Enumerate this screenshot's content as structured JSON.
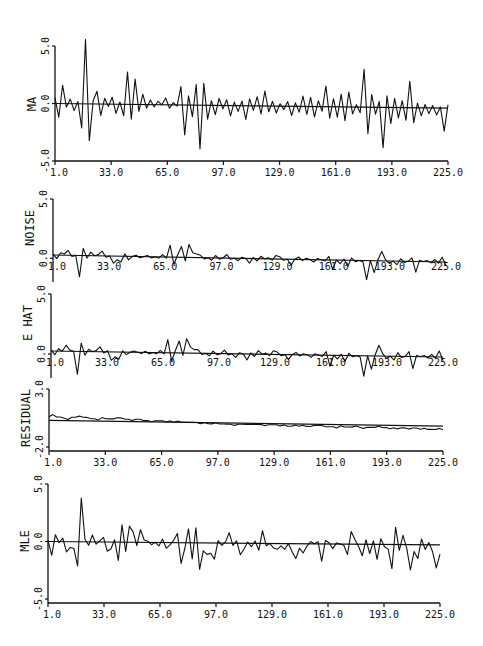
{
  "chart_data": [
    {
      "type": "line",
      "panel": "MA",
      "ylabel": "MA",
      "yticks": [
        "5.0",
        "0.0",
        "-5.0"
      ],
      "ylim": [
        -5.0,
        5.0
      ],
      "xticks": [
        "1.0",
        "33.0",
        "65.0",
        "97.0",
        "129.0",
        "161.0",
        "193.0",
        "225.0"
      ],
      "xlim": [
        1,
        225
      ],
      "baseline": [
        0.0,
        -0.4
      ],
      "x_step": 3,
      "values": [
        0.5,
        -1.2,
        1.6,
        -0.3,
        0.4,
        -0.6,
        0.2,
        -2.1,
        5.6,
        -3.2,
        0.3,
        1.1,
        -1.0,
        0.5,
        -0.2,
        0.6,
        -0.8,
        0.2,
        -1.0,
        2.8,
        -1.3,
        2.2,
        -0.6,
        0.9,
        -0.3,
        0.4,
        -0.2,
        0.3,
        0.0,
        0.6,
        -0.3,
        0.2,
        -0.1,
        1.6,
        -2.6,
        0.8,
        -1.0,
        1.8,
        -3.8,
        1.9,
        -1.2,
        0.4,
        -0.8,
        0.6,
        -0.3,
        0.5,
        -0.9,
        0.3,
        -0.5,
        0.4,
        -1.2,
        0.6,
        -0.4,
        0.8,
        -0.7,
        1.3,
        -0.5,
        0.4,
        -0.6,
        0.2,
        -0.3,
        0.4,
        -0.8,
        0.3,
        -0.5,
        0.9,
        -0.7,
        0.8,
        -0.9,
        0.5,
        -0.4,
        1.8,
        -1.0,
        0.7,
        -0.9,
        1.1,
        -1.2,
        1.3,
        -0.6,
        0.2,
        -0.5,
        3.3,
        -2.3,
        1.1,
        -0.6,
        0.5,
        -3.5,
        1.0,
        -1.4,
        0.8,
        -0.9,
        0.6,
        -1.1,
        2.3,
        -1.3,
        0.4,
        -0.7,
        0.3,
        -0.5,
        0.2,
        -0.6,
        0.1,
        -2.0,
        0.3
      ],
      "title": ""
    },
    {
      "type": "line",
      "panel": "NOISE",
      "ylabel": "NOISE",
      "yticks": [
        "5.0",
        "0.0"
      ],
      "ylim": [
        -2.0,
        5.0
      ],
      "xticks": [
        "1.0",
        "33.0",
        "65.0",
        "97.0",
        "129.0",
        "161.0",
        "193.0",
        "225.0"
      ],
      "xlim": [
        1,
        225
      ],
      "baseline": [
        0.0,
        -0.5
      ],
      "x_step": 3,
      "values": [
        0.1,
        -0.3,
        0.2,
        0.1,
        0.4,
        -0.1,
        0.0,
        -1.8,
        0.6,
        -0.2,
        0.3,
        0.0,
        0.1,
        0.4,
        -0.1,
        0.0,
        -0.6,
        -0.3,
        -0.5,
        0.2,
        -0.3,
        0.0,
        0.1,
        -0.1,
        0.0,
        0.1,
        -0.1,
        0.0,
        -0.1,
        0.2,
        -0.1,
        1.0,
        -0.6,
        0.2,
        0.9,
        -0.3,
        1.1,
        0.4,
        0.3,
        0.2,
        -0.1,
        0.0,
        -0.2,
        0.2,
        -0.1,
        0.0,
        0.3,
        -0.1,
        0.0,
        -0.2,
        0.1,
        0.0,
        -0.4,
        0.1,
        -0.2,
        0.2,
        0.0,
        0.1,
        -0.1,
        0.3,
        0.2,
        -0.1,
        0.0,
        -0.5,
        0.0,
        0.2,
        -0.1,
        0.1,
        0.0,
        -0.2,
        0.1,
        0.0,
        -0.1,
        0.3,
        -0.8,
        0.0,
        -0.3,
        0.1,
        -0.5,
        0.2,
        -0.1,
        0.0,
        -0.1,
        -1.6,
        0.0,
        -1.0,
        0.1,
        0.8,
        0.1,
        -0.2,
        0.0,
        -0.3,
        0.2,
        -0.1,
        0.0,
        0.3,
        -0.9,
        0.1,
        0.0,
        0.1,
        -0.1,
        0.2,
        -0.1,
        0.4,
        -0.3
      ],
      "title": ""
    },
    {
      "type": "line",
      "panel": "E HAT",
      "ylabel": "E HAT",
      "yticks": [
        "5.0",
        "0.0"
      ],
      "ylim": [
        -2.0,
        5.0
      ],
      "xticks": [
        "1.0",
        "33.0",
        "65.0",
        "97.0",
        "129.0",
        "161.0",
        "193.0",
        "225.0"
      ],
      "xlim": [
        1,
        225
      ],
      "baseline": [
        0.0,
        -0.5
      ],
      "x_step": 3,
      "values": [
        0.1,
        -0.3,
        0.2,
        0.0,
        0.5,
        0.1,
        0.0,
        -1.9,
        0.7,
        -0.3,
        0.2,
        0.0,
        0.1,
        0.4,
        -0.1,
        0.1,
        -0.7,
        -0.4,
        -0.6,
        0.1,
        -0.2,
        0.0,
        0.1,
        0.0,
        -0.1,
        0.1,
        -0.1,
        0.0,
        -0.1,
        0.2,
        -0.1,
        1.1,
        -0.7,
        0.2,
        1.0,
        -0.2,
        1.2,
        0.5,
        0.3,
        0.3,
        -0.1,
        0.0,
        -0.2,
        0.2,
        -0.1,
        0.0,
        0.3,
        -0.1,
        0.0,
        -0.3,
        0.1,
        0.0,
        -0.5,
        0.1,
        -0.2,
        0.3,
        0.0,
        0.1,
        -0.1,
        0.3,
        0.2,
        -0.1,
        0.0,
        -0.4,
        0.0,
        0.2,
        -0.1,
        0.1,
        0.0,
        -0.2,
        0.1,
        0.0,
        -0.1,
        0.3,
        -0.9,
        0.0,
        -0.3,
        0.1,
        -0.5,
        0.2,
        -0.1,
        0.0,
        -0.1,
        -1.7,
        0.0,
        -1.1,
        0.1,
        0.9,
        0.2,
        -0.2,
        0.0,
        -0.3,
        0.3,
        -0.1,
        0.0,
        0.4,
        -1.0,
        0.1,
        0.0,
        0.1,
        -0.1,
        0.2,
        -0.1,
        0.5,
        -0.3
      ],
      "title": ""
    },
    {
      "type": "line",
      "panel": "RESIDUAL",
      "ylabel": "RESIDUAL",
      "yticks": [
        "3.0",
        "-2.0"
      ],
      "ylim": [
        -2.0,
        3.0
      ],
      "xticks": [
        "1.0",
        "33.0",
        "65.0",
        "97.0",
        "129.0",
        "161.0",
        "193.0",
        "225.0"
      ],
      "xlim": [
        1,
        225
      ],
      "baseline": [
        0.3,
        -0.2
      ],
      "x_step": 3,
      "values": [
        0.3,
        0.5,
        0.3,
        0.3,
        0.2,
        0.1,
        0.3,
        0.3,
        0.4,
        0.3,
        0.3,
        0.2,
        0.2,
        0.1,
        0.3,
        0.2,
        0.2,
        0.2,
        0.3,
        0.3,
        0.2,
        0.2,
        0.1,
        0.2,
        0.2,
        0.1,
        0.1,
        0.0,
        0.1,
        0.1,
        0.1,
        0.0,
        0.1,
        0.0,
        0.1,
        0.0,
        0.0,
        0.0,
        0.0,
        0.0,
        -0.1,
        0.0,
        -0.1,
        -0.1,
        0.0,
        -0.1,
        -0.1,
        -0.1,
        -0.1,
        -0.2,
        -0.1,
        -0.1,
        -0.1,
        -0.1,
        -0.1,
        -0.1,
        -0.1,
        -0.2,
        -0.1,
        -0.1,
        -0.1,
        -0.2,
        -0.1,
        -0.2,
        -0.2,
        -0.1,
        -0.2,
        -0.1,
        -0.2,
        -0.2,
        -0.1,
        -0.1,
        -0.1,
        -0.2,
        -0.2,
        -0.2,
        -0.3,
        -0.1,
        -0.2,
        -0.2,
        -0.2,
        -0.1,
        -0.2,
        -0.3,
        -0.2,
        -0.2,
        -0.2,
        -0.1,
        -0.2,
        -0.2,
        -0.3,
        -0.2,
        -0.3,
        -0.2,
        -0.2,
        -0.3,
        -0.2,
        -0.2,
        -0.3,
        -0.2,
        -0.3,
        -0.3,
        -0.3,
        -0.2,
        -0.3
      ],
      "title": ""
    },
    {
      "type": "line",
      "panel": "MLE",
      "ylabel": "MLE",
      "yticks": [
        "5.0",
        "0.0",
        "-5.0"
      ],
      "ylim": [
        -5.0,
        5.0
      ],
      "xticks": [
        "1.0",
        "33.0",
        "65.0",
        "97.0",
        "129.0",
        "161.0",
        "193.0",
        "225.0"
      ],
      "xlim": [
        1,
        225
      ],
      "baseline": [
        0.0,
        -0.3
      ],
      "x_step": 3,
      "values": [
        0.1,
        -1.2,
        0.6,
        -0.1,
        0.3,
        -0.9,
        -0.5,
        -0.6,
        -2.1,
        3.8,
        0.2,
        -0.3,
        0.6,
        -0.2,
        0.1,
        0.4,
        -0.8,
        -0.6,
        0.2,
        -1.6,
        1.5,
        -0.8,
        1.4,
        0.9,
        -0.3,
        1.1,
        0.2,
        0.1,
        -0.2,
        0.0,
        -0.3,
        0.3,
        -0.5,
        -0.2,
        0.2,
        0.8,
        -1.8,
        -0.5,
        1.2,
        -1.4,
        1.3,
        -2.3,
        -0.7,
        -1.0,
        -0.9,
        -1.4,
        0.2,
        -0.2,
        0.1,
        0.9,
        -0.2,
        0.2,
        -1.0,
        -0.5,
        0.1,
        -0.3,
        0.2,
        -0.6,
        1.1,
        -0.2,
        0.0,
        -0.4,
        -0.5,
        -0.2,
        -0.5,
        0.0,
        -0.7,
        -1.3,
        -0.4,
        -0.8,
        -0.2,
        0.2,
        0.0,
        0.2,
        -1.5,
        0.3,
        0.1,
        -0.4,
        0.1,
        0.0,
        -0.1,
        -0.9,
        1.1,
        0.4,
        -0.2,
        -1.0,
        0.4,
        -0.8,
        0.3,
        -1.3,
        0.5,
        -0.2,
        -0.4,
        -2.1,
        1.5,
        -0.5,
        0.8,
        -0.3,
        -2.2,
        -0.6,
        -1.2,
        0.5,
        -0.4,
        0.2,
        -0.6,
        -2.0,
        -0.8
      ]
    }
  ]
}
